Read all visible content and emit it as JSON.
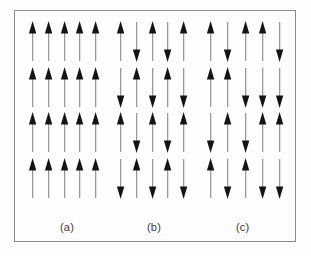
{
  "figure": {
    "background_color": "#fdfdfd",
    "border_color": "#8a8a8a",
    "arrow_head_color": "#141414",
    "arrow_shaft_color": "#9a9a9a"
  },
  "panels": [
    {
      "id": "a",
      "caption": "(a)",
      "ordering": "ferromagnetic",
      "rows": 4,
      "cols": 5,
      "spins": [
        [
          "up",
          "up",
          "up",
          "up",
          "up"
        ],
        [
          "up",
          "up",
          "up",
          "up",
          "up"
        ],
        [
          "up",
          "up",
          "up",
          "up",
          "up"
        ],
        [
          "up",
          "up",
          "up",
          "up",
          "up"
        ]
      ]
    },
    {
      "id": "b",
      "caption": "(b)",
      "ordering": "antiferromagnetic",
      "rows": 4,
      "cols": 5,
      "spins": [
        [
          "up",
          "down",
          "up",
          "down",
          "up"
        ],
        [
          "down",
          "up",
          "down",
          "up",
          "down"
        ],
        [
          "up",
          "down",
          "up",
          "down",
          "up"
        ],
        [
          "down",
          "up",
          "down",
          "up",
          "down"
        ]
      ]
    },
    {
      "id": "c",
      "caption": "(c)",
      "ordering": "ferrimagnetic",
      "rows": 4,
      "cols": 5,
      "spins": [
        [
          "up",
          "down",
          "up",
          "up",
          "down"
        ],
        [
          "up",
          "up",
          "down",
          "down",
          "down"
        ],
        [
          "down",
          "up",
          "down",
          "up",
          "up"
        ],
        [
          "up",
          "down",
          "up",
          "down",
          "down"
        ]
      ]
    }
  ]
}
